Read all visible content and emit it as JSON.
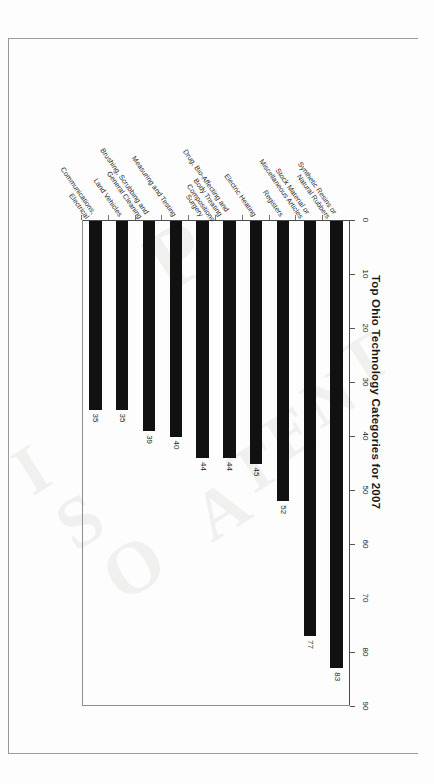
{
  "document": {
    "orientation": "landscape-rotated-90",
    "watermark_letters": [
      "I",
      "S",
      "O",
      "P",
      "A",
      "T",
      "E",
      "N",
      "T"
    ]
  },
  "chart_data": {
    "type": "bar",
    "orientation": "horizontal",
    "title": "Top Ohio Technology Categories for 2007",
    "xlabel": "",
    "ylabel": "",
    "xlim": [
      0,
      90
    ],
    "xticks": [
      0,
      10,
      20,
      30,
      40,
      50,
      60,
      70,
      80,
      90
    ],
    "grid": false,
    "legend": false,
    "bar_color": "#111111",
    "categories": [
      "Synthetic Resins or\nNatural Rubbers",
      "Stock Material or\nMiscellaneous Articles",
      "Registers",
      "Electric Heating",
      "Drug, Bio-Affecting and\nBody Treating\nCompositions",
      "Surgery",
      "Measuring and Testing",
      "Brushing, Scrubbing and\nGeneral Cleaning",
      "Land Vehicles",
      "Communications,\nElectrical"
    ],
    "values": [
      83,
      77,
      52,
      45,
      44,
      44,
      40,
      39,
      35,
      35
    ],
    "data_labels": [
      "83",
      "77",
      "52",
      "45",
      "44",
      "44",
      "40",
      "39",
      "35",
      "35"
    ]
  }
}
